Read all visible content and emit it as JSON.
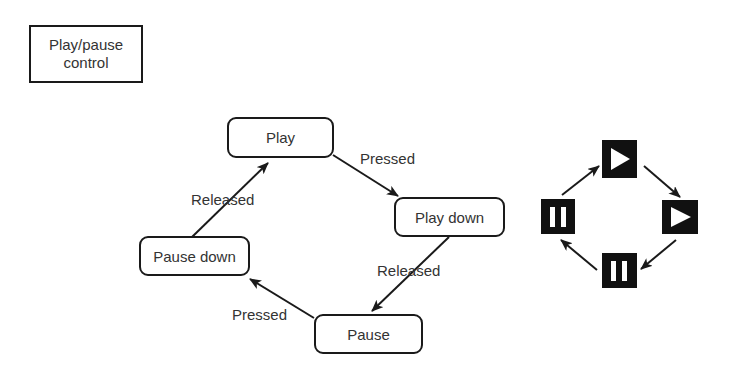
{
  "title": {
    "line1": "Play/pause",
    "line2": "control"
  },
  "states": {
    "play": "Play",
    "play_down": "Play down",
    "pause": "Pause",
    "pause_down": "Pause down"
  },
  "transitions": [
    {
      "from": "Play",
      "to": "Play down",
      "label": "Pressed"
    },
    {
      "from": "Play down",
      "to": "Pause",
      "label": "Released"
    },
    {
      "from": "Pause",
      "to": "Pause down",
      "label": "Pressed"
    },
    {
      "from": "Pause down",
      "to": "Play",
      "label": "Released"
    }
  ],
  "edge_labels": {
    "play_to_play_down": "Pressed",
    "play_down_to_pause": "Released",
    "pause_to_pause_down": "Pressed",
    "pause_down_to_play": "Released"
  },
  "icon_cycle": [
    {
      "position": "top",
      "icon": "play-icon"
    },
    {
      "position": "right",
      "icon": "play-icon"
    },
    {
      "position": "bottom",
      "icon": "pause-icon"
    },
    {
      "position": "left",
      "icon": "pause-icon"
    }
  ],
  "colors": {
    "stroke": "#1a1a1a",
    "text": "#333333",
    "icon_bg": "#111111",
    "icon_fg": "#ffffff",
    "background": "#ffffff"
  }
}
